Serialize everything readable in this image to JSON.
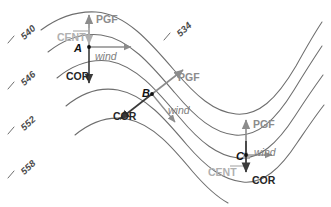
{
  "figure": {
    "width": 331,
    "height": 207,
    "background": "#ffffff"
  },
  "colors": {
    "contour_line": "#6e6e6e",
    "pgf_arrow": "#8c8c8c",
    "cent_arrow": "#b0b0b0",
    "cor_arrow": "#3a3a3a",
    "wind_arrow": "#8c8c8c",
    "point_marker": "#111111",
    "contour_label_text": "#4a4a4a"
  },
  "contours": {
    "note": "500 mb height contours in decameters",
    "labels": [
      {
        "id": "c540",
        "value": "540",
        "x": 22,
        "y": 33,
        "rotation": -42
      },
      {
        "id": "c546",
        "value": "546",
        "x": 22,
        "y": 79,
        "rotation": -42
      },
      {
        "id": "c552",
        "value": "552",
        "x": 22,
        "y": 124,
        "rotation": -42
      },
      {
        "id": "c558",
        "value": "558",
        "x": 22,
        "y": 168,
        "rotation": -42
      },
      {
        "id": "c534",
        "value": "534",
        "x": 178,
        "y": 30,
        "rotation": -42
      }
    ],
    "values": [
      "534",
      "540",
      "546",
      "552",
      "558"
    ]
  },
  "points": [
    {
      "id": "A",
      "label": "A",
      "label_x": 74,
      "label_y": 43,
      "marker_x": 89,
      "marker_y": 47,
      "flow_type": "ridge",
      "forces": [
        {
          "name": "PGF",
          "label": "PGF",
          "direction": "up",
          "style": "pgf",
          "label_x": 96,
          "label_y": 14
        },
        {
          "name": "CENT",
          "label": "CENT",
          "direction": "down",
          "style": "cent",
          "label_x": 57,
          "label_y": 32
        },
        {
          "name": "COR",
          "label": "COR",
          "direction": "down",
          "style": "cor",
          "label_x": 66,
          "label_y": 71
        },
        {
          "name": "wind",
          "label": "wind",
          "direction": "right",
          "style": "wind",
          "label_x": 95,
          "label_y": 51
        }
      ]
    },
    {
      "id": "B",
      "label": "B",
      "label_x": 142,
      "label_y": 88,
      "marker_x": 152,
      "marker_y": 94,
      "flow_type": "straight",
      "forces": [
        {
          "name": "PGF",
          "label": "PGF",
          "direction": "up-right",
          "style": "pgf",
          "label_x": 178,
          "label_y": 72
        },
        {
          "name": "COR",
          "label": "COR",
          "direction": "down-left",
          "style": "cor",
          "label_x": 113,
          "label_y": 111
        },
        {
          "name": "wind",
          "label": "wind",
          "direction": "down-right",
          "style": "wind",
          "label_x": 168,
          "label_y": 105
        }
      ]
    },
    {
      "id": "C",
      "label": "C",
      "label_x": 236,
      "label_y": 151,
      "marker_x": 246,
      "marker_y": 155,
      "flow_type": "trough",
      "forces": [
        {
          "name": "PGF",
          "label": "PGF",
          "direction": "up",
          "style": "pgf",
          "label_x": 253,
          "label_y": 119
        },
        {
          "name": "CENT",
          "label": "CENT",
          "direction": "up",
          "style": "cent",
          "label_x": 208,
          "label_y": 167
        },
        {
          "name": "COR",
          "label": "COR",
          "direction": "down",
          "style": "cor",
          "label_x": 252,
          "label_y": 175
        },
        {
          "name": "wind",
          "label": "wind",
          "direction": "right",
          "style": "wind",
          "label_x": 254,
          "label_y": 147
        }
      ]
    }
  ],
  "legend_terms": {
    "pgf": "PGF",
    "cent": "CENT",
    "cor": "COR",
    "wind": "wind"
  }
}
